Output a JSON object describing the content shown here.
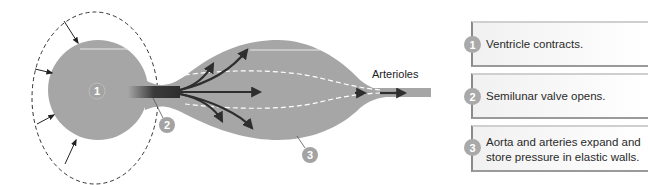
{
  "diagram": {
    "labels": {
      "arterioles": "Arterioles",
      "marker_1": "1",
      "marker_2": "2",
      "marker_3": "3"
    },
    "colors": {
      "chamber_fill": "#a6a6a6",
      "marker_fill": "#a3a3a3",
      "arrow": "#2e2e2e",
      "dashed_outline": "#333333"
    }
  },
  "steps": [
    {
      "number": "1",
      "text": "Ventricle contracts."
    },
    {
      "number": "2",
      "text": "Semilunar valve opens."
    },
    {
      "number": "3",
      "text_line1": "Aorta and arteries expand and",
      "text_line2": "store pressure in elastic walls."
    }
  ]
}
